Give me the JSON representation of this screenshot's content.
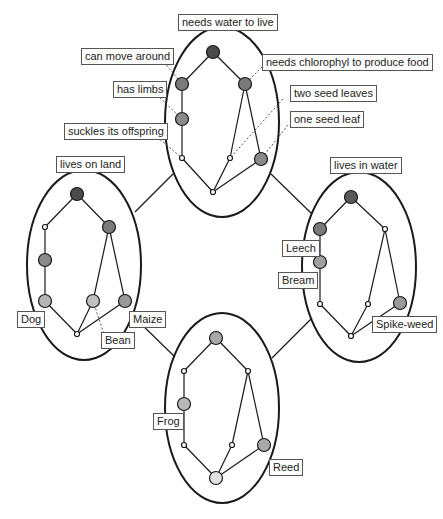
{
  "colors": {
    "dark": "#4a4a4a",
    "mid": "#7a7a7a",
    "light": "#a8a8a8",
    "pale": "#cfcfcf",
    "line": "#1a1a1a",
    "dashed": "#555555"
  },
  "lattices": {
    "top": {
      "label": "needs water to live",
      "annotations": {
        "can_move_around": "can move around",
        "has_limbs": "has limbs",
        "suckles": "suckles its offspring",
        "chlorophyl": "needs chlorophyl to produce food",
        "two_seed": "two seed leaves",
        "one_seed": "one seed leaf"
      }
    },
    "left": {
      "label": "lives on land",
      "objects": {
        "dog": "Dog",
        "bean": "Bean",
        "maize": "Maize"
      }
    },
    "right": {
      "label": "lives in water",
      "objects": {
        "leech": "Leech",
        "bream": "Bream",
        "spikeweed": "Spike-weed"
      }
    },
    "bottom": {
      "objects": {
        "frog": "Frog",
        "reed": "Reed"
      }
    }
  }
}
